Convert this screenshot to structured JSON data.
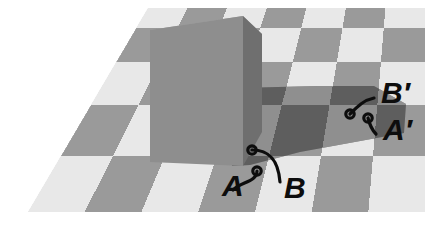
{
  "figure": {
    "width": 447,
    "height": 226,
    "background_color": "#ffffff"
  },
  "colors": {
    "background": "#ffffff",
    "check_light": "#e8e8e8",
    "check_dark": "#9a9a9a",
    "check_light_shadowed": "#8f8f8f",
    "check_dark_shadowed": "#5e5e5e",
    "check_dark_shadow_core": "#4a4a4a",
    "cube_left_face": "#8e8e8e",
    "cube_right_face": "#6f6f6f",
    "cube_top_face": "#a5a5a5",
    "label_ink": "#0d0d0d",
    "leader_line": "#0d0d0d"
  },
  "board": {
    "name": "checkerboard-plane",
    "corners": {
      "top_left": [
        148,
        8
      ],
      "top_right": [
        425,
        8
      ],
      "bottom_right": [
        425,
        212
      ],
      "bottom_left": [
        28,
        212
      ]
    },
    "columns": 7,
    "rows": 5,
    "pattern": "alternating light and dark squares in perspective"
  },
  "cube": {
    "name": "green-cylinder-block",
    "left_face_shade": "medium gray",
    "right_face_shade": "dark gray",
    "top_face_shade": "light gray",
    "apex_top": [
      243,
      16
    ],
    "base_bottom": [
      240,
      165
    ]
  },
  "shadow": {
    "name": "cast-shadow",
    "direction": "toward lower right",
    "start": [
      232,
      95
    ],
    "end": [
      400,
      140
    ]
  },
  "labels": [
    {
      "id": "label-A",
      "text": "A",
      "x": 222,
      "y": 196,
      "marker_x": 257,
      "marker_y": 171,
      "in_shadow": false,
      "square_tone": "light"
    },
    {
      "id": "label-B",
      "text": "B",
      "x": 284,
      "y": 198,
      "marker_x": 252,
      "marker_y": 150,
      "in_shadow": true,
      "square_tone": "light"
    },
    {
      "id": "label-A-prime",
      "text": "A′",
      "x": 383,
      "y": 140,
      "marker_x": 368,
      "marker_y": 118,
      "in_shadow": false,
      "square_tone": "light"
    },
    {
      "id": "label-B-prime",
      "text": "B′",
      "x": 381,
      "y": 103,
      "marker_x": 350,
      "marker_y": 114,
      "in_shadow": true,
      "square_tone": "light"
    }
  ]
}
